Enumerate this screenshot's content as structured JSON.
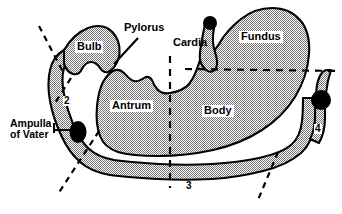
{
  "figure": {
    "background_color": "#ffffff",
    "outline_color": "#000000",
    "fill_color": "#b4b4b4",
    "marker_color": "#000000",
    "dashed_line_color": "#000000"
  },
  "labels": {
    "pylorus": {
      "text": "Pylorus",
      "x": 124,
      "y": 28,
      "size": 11,
      "boxed": false
    },
    "cardia": {
      "text": "Cardia",
      "x": 173,
      "y": 42,
      "size": 11,
      "boxed": false
    },
    "fundus": {
      "text": "Fundus",
      "x": 239,
      "y": 36,
      "size": 11,
      "boxed": true
    },
    "bulb": {
      "text": "Bulb",
      "x": 75,
      "y": 46,
      "size": 11,
      "boxed": true
    },
    "antrum": {
      "text": "Antrum",
      "x": 110,
      "y": 105,
      "size": 11,
      "boxed": true
    },
    "body": {
      "text": "Body",
      "x": 202,
      "y": 110,
      "size": 11,
      "boxed": true
    },
    "ampulla_line1": {
      "text": "Ampulla",
      "x": 10,
      "y": 123,
      "size": 10.5,
      "boxed": false
    },
    "ampulla_line2": {
      "text": "of Vater",
      "x": 10,
      "y": 134,
      "size": 10.5,
      "boxed": false
    }
  },
  "numbered_segments": [
    {
      "number": "2",
      "name": "descending-duodenum",
      "x": 63,
      "y": 100,
      "size": 10
    },
    {
      "number": "3",
      "name": "horizontal-duodenum",
      "x": 185,
      "y": 185,
      "size": 10
    },
    {
      "number": "4",
      "name": "ascending-duodenum",
      "x": 314,
      "y": 128,
      "size": 10
    }
  ],
  "markers": [
    {
      "name": "esophagus-top-marker",
      "cx": 210,
      "cy": 23,
      "rx": 7,
      "ry": 7
    },
    {
      "name": "ampulla-of-vater-marker",
      "cx": 78,
      "cy": 132,
      "rx": 8.5,
      "ry": 11
    },
    {
      "name": "ligament-of-treitz-marker",
      "cx": 321,
      "cy": 100,
      "rx": 10,
      "ry": 10
    }
  ],
  "leader_lines": [
    {
      "name": "pylorus-leader",
      "x1": 138,
      "y1": 38,
      "x2": 114,
      "y2": 64
    },
    {
      "name": "ampulla-leader",
      "x1": 54,
      "y1": 130,
      "x2": 73,
      "y2": 130
    }
  ],
  "dashed_lines": [
    {
      "name": "bulb-divider-dashed",
      "x1": 39,
      "y1": 26,
      "x2": 63,
      "y2": 72
    },
    {
      "name": "duodenal-bulb-lower-dashed",
      "x1": 71,
      "y1": 80,
      "x2": 55,
      "y2": 102
    },
    {
      "name": "antrum-body-vertical-dashed",
      "x1": 170,
      "y1": 56,
      "x2": 170,
      "y2": 188
    },
    {
      "name": "fundus-body-horizontal-dashed",
      "x1": 185,
      "y1": 69,
      "x2": 340,
      "y2": 71
    },
    {
      "name": "duodenum-2-3-dashed",
      "x1": 99,
      "y1": 131,
      "x2": 58,
      "y2": 194
    },
    {
      "name": "duodenum-3-4-dashed",
      "x1": 278,
      "y1": 152,
      "x2": 258,
      "y2": 200
    }
  ]
}
